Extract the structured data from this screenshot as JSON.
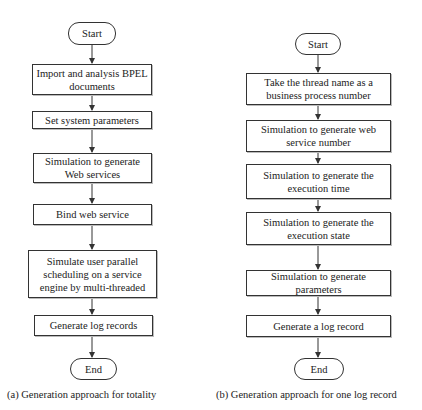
{
  "figure_a": {
    "caption": "(a) Generation approach for totality",
    "start": "Start",
    "steps": [
      "Import and analysis BPEL documents",
      "Set system parameters",
      "Simulation to generate Web services",
      "Bind web service",
      "Simulate user parallel scheduling on a service engine by multi-threaded",
      "Generate log records"
    ],
    "end": "End"
  },
  "figure_b": {
    "caption": "(b) Generation approach for one log record",
    "start": "Start",
    "steps": [
      "Take the thread name as a business process number",
      "Simulation to generate web service number",
      "Simulation to generate the execution time",
      "Simulation to generate the execution state",
      "Simulation to generate parameters",
      "Generate a log record"
    ],
    "end": "End"
  },
  "colors": {
    "stroke": "#333333",
    "background": "#ffffff",
    "text": "#222222"
  }
}
